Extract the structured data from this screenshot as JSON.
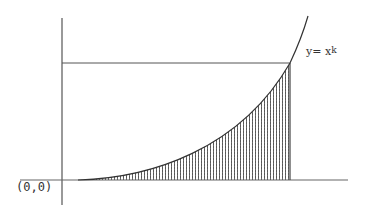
{
  "diagram": {
    "title": "",
    "origin_label": "(0,0)",
    "curve_label": {
      "base": "y= x",
      "exponent": "k"
    },
    "curve": {
      "equation": "y = x^k",
      "shaded_region": "area under curve from 0 to x=1"
    },
    "colors": {
      "axis": "#555555",
      "curve": "#333333",
      "hatch": "#444444",
      "background": "#ffffff"
    }
  }
}
